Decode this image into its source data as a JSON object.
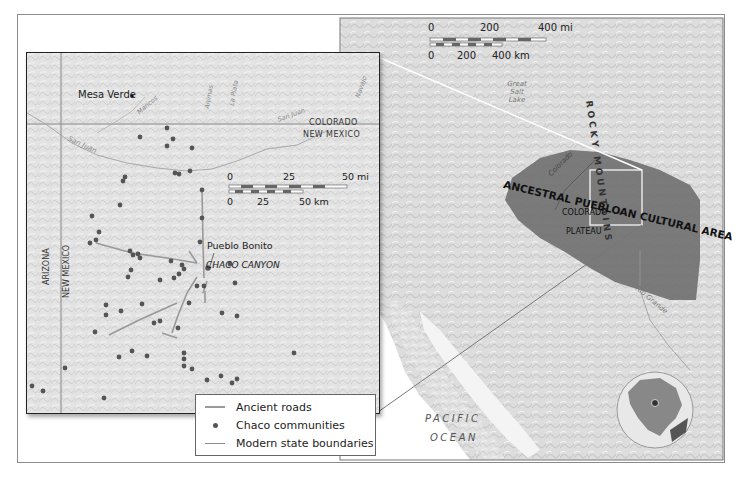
{
  "main_map": {
    "scale_bar": {
      "miles_ticks": [
        "0",
        "200",
        "400 mi"
      ],
      "km_ticks": [
        "0",
        "200",
        "400 km"
      ]
    },
    "labels": {
      "rocky_mountains": "ROCKY MOUNTAINS",
      "great_salt_lake": "Great Salt Lake",
      "colorado_river": "Colorado",
      "rio_grande": "Rio Grande",
      "cultural_area": "ANCESTRAL PUEBLOAN CULTURAL AREA",
      "plateau_line1": "COLORADO",
      "plateau_line2": "PLATEAU",
      "ocean_line1": "PACIFIC",
      "ocean_line2": "OCEAN"
    },
    "colors": {
      "cultural_area_fill": "#6f6f6f",
      "land": "#dcdcdc",
      "water": "#ffffff",
      "connector_line": "#ffffff"
    },
    "locator_globe": {
      "marker": "location-pin"
    }
  },
  "inset_map": {
    "scale_bar": {
      "miles_ticks": [
        "0",
        "25",
        "50 mi"
      ],
      "km_ticks": [
        "0",
        "25",
        "50 km"
      ]
    },
    "labels": {
      "mesa_verde": "Mesa Verde",
      "colorado": "COLORADO",
      "new_mexico_top": "NEW MEXICO",
      "arizona": "ARIZONA",
      "new_mexico_side": "NEW MEXICO",
      "pueblo_bonito": "Pueblo Bonito",
      "chaco_canyon": "CHACO CANYON",
      "san_juan": "San Juan",
      "mancos": "Mancos",
      "animas": "Animas",
      "la_plata": "La Plata",
      "san_juan_upper": "San Juan",
      "navajo": "Navajo"
    }
  },
  "legend": {
    "items": [
      {
        "symbol": "line",
        "label": "Ancient roads"
      },
      {
        "symbol": "dot",
        "label": "Chaco communities"
      },
      {
        "symbol": "line",
        "label": "Modern state boundaries"
      }
    ]
  }
}
